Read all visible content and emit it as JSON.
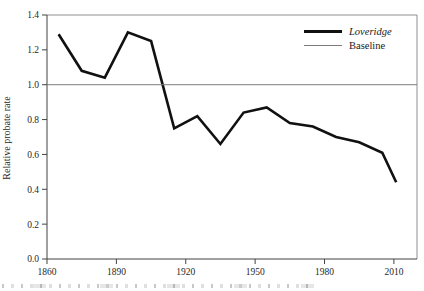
{
  "figure": {
    "background": "#ffffff"
  },
  "colors": {
    "axis": "#434343",
    "frame_light": "#8f8f8f",
    "baseline_line": "#7d7d7d",
    "series_line": "#111111",
    "tick_text": "#1f1f1f"
  },
  "legend": {
    "items": [
      {
        "label": "Loveridge",
        "swatch": "thick-black-line"
      },
      {
        "label": "Baseline",
        "swatch": "thin-gray-line"
      }
    ]
  },
  "chart_data": {
    "type": "line",
    "title": "",
    "xlabel": "",
    "ylabel": "Relative probate rate",
    "xlim": [
      1860,
      2020
    ],
    "ylim": [
      0.0,
      1.4
    ],
    "x_tick_values": [
      1860,
      1890,
      1920,
      1950,
      1980,
      2010
    ],
    "x_tick_labels": [
      "1860",
      "1890",
      "1920",
      "1950",
      "1980",
      "2010"
    ],
    "y_tick_values": [
      0.0,
      0.2,
      0.4,
      0.6,
      0.8,
      1.0,
      1.2,
      1.4
    ],
    "y_tick_labels": [
      "0.0",
      "0.2",
      "0.4",
      "0.6",
      "0.8",
      "1.0",
      "1.2",
      "1.4"
    ],
    "grid": false,
    "legend_position": "top-right-inside",
    "series": [
      {
        "name": "Loveridge",
        "type": "line",
        "color": "#111111",
        "stroke_width": 2.6,
        "x": [
          1865,
          1875,
          1885,
          1895,
          1905,
          1915,
          1925,
          1935,
          1945,
          1955,
          1965,
          1975,
          1985,
          1995,
          2005,
          2011
        ],
        "y": [
          1.29,
          1.08,
          1.04,
          1.3,
          1.25,
          0.75,
          0.82,
          0.66,
          0.84,
          0.87,
          0.78,
          0.76,
          0.7,
          0.67,
          0.61,
          0.44
        ]
      },
      {
        "name": "Baseline",
        "type": "hline",
        "color": "#7d7d7d",
        "stroke_width": 1,
        "y_value": 1.0
      }
    ]
  }
}
